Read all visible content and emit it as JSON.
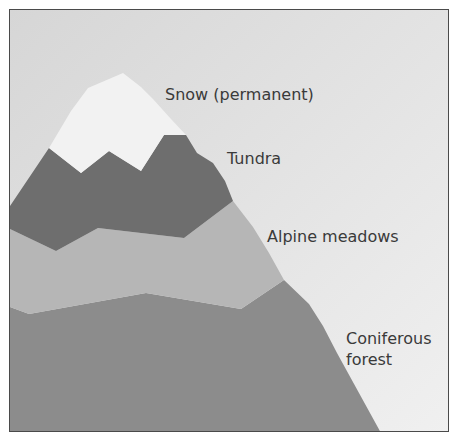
{
  "diagram": {
    "type": "mountain-vegetation-zones",
    "colors": {
      "sky": "#d8d8d8",
      "sky_light": "#ececec",
      "snow": "#f2f2f2",
      "tundra": "#6e6e6e",
      "alpine_meadows": "#b6b6b6",
      "coniferous_forest": "#8c8c8c",
      "border": "#4a4a4a",
      "text": "#3a3a3a"
    },
    "zones": [
      {
        "id": "snow",
        "label": "Snow (permanent)"
      },
      {
        "id": "tundra",
        "label": "Tundra"
      },
      {
        "id": "alpine-meadows",
        "label": "Alpine meadows"
      },
      {
        "id": "coniferous-forest",
        "label_line1": "Coniferous",
        "label_line2": "forest"
      }
    ]
  }
}
